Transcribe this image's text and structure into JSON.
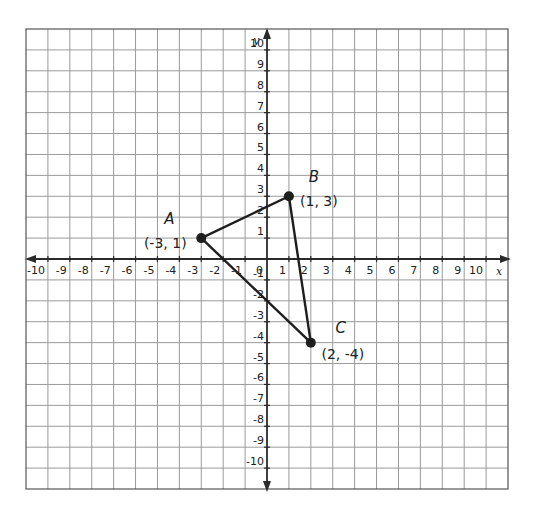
{
  "chart_data": {
    "type": "scatter",
    "title": "",
    "xlabel": "x",
    "ylabel": "y",
    "xlim": [
      -11,
      11
    ],
    "ylim": [
      -11,
      11
    ],
    "grid": true,
    "x_ticks": [
      -10,
      -9,
      -8,
      -7,
      -6,
      -5,
      -4,
      -3,
      -2,
      -1,
      1,
      2,
      3,
      4,
      5,
      6,
      7,
      8,
      9,
      10
    ],
    "y_ticks": [
      -10,
      -9,
      -8,
      -7,
      -6,
      -5,
      -4,
      -3,
      -2,
      -1,
      1,
      2,
      3,
      4,
      5,
      6,
      7,
      8,
      9,
      10
    ],
    "origin_label": "0",
    "shape": "triangle",
    "points": [
      {
        "name": "A",
        "x": -3,
        "y": 1,
        "label": "(-3, 1)"
      },
      {
        "name": "B",
        "x": 1,
        "y": 3,
        "label": "(1, 3)"
      },
      {
        "name": "C",
        "x": 2,
        "y": -4,
        "label": "(2, -4)"
      }
    ],
    "edges": [
      [
        "A",
        "B"
      ],
      [
        "B",
        "C"
      ],
      [
        "C",
        "A"
      ]
    ]
  },
  "colors": {
    "grid": "#9a9a9a",
    "axis": "#2a2a2a",
    "shape": "#1e1e1e"
  }
}
